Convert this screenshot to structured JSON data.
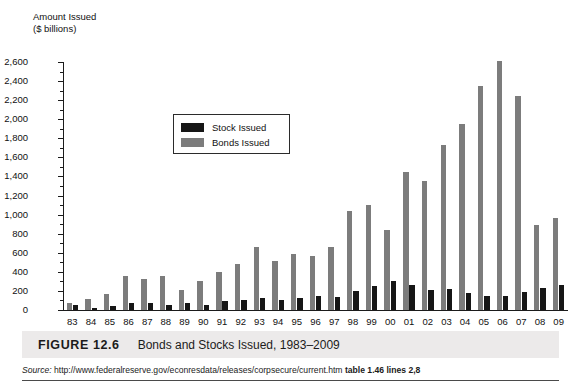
{
  "figure": {
    "number_label": "FIGURE 12.6",
    "title": "Bonds and Stocks Issued, 1983–2009",
    "source_prefix": "Source:",
    "source_url": "http://www.federalreserve.gov/econresdata/releases/corpsecure/current.htm",
    "source_detail": "table 1.46 lines 2,8"
  },
  "legend": {
    "position": "inside-top-left",
    "entries": [
      {
        "label": "Stock Issued",
        "color": "#161616"
      },
      {
        "label": "Bonds Issued",
        "color": "#7c7c7c"
      }
    ]
  },
  "axis": {
    "y_title_line1": "Amount Issued",
    "y_title_line2": "($ billions)",
    "y_ticks": [
      "0",
      "200",
      "400",
      "600",
      "800",
      "1,000",
      "1,200",
      "1,400",
      "1,600",
      "1,800",
      "2,000",
      "2,200",
      "2,400",
      "2,600"
    ]
  },
  "chart_data": {
    "type": "bar",
    "title": "Bonds and Stocks Issued, 1983–2009",
    "xlabel": "",
    "ylabel": "Amount Issued ($ billions)",
    "ylim": [
      0,
      2600
    ],
    "ytick_step": 200,
    "grid": false,
    "legend_position": "upper-left-inside",
    "categories": [
      "83",
      "84",
      "85",
      "86",
      "87",
      "88",
      "89",
      "90",
      "91",
      "92",
      "93",
      "94",
      "95",
      "96",
      "97",
      "98",
      "99",
      "00",
      "01",
      "02",
      "03",
      "04",
      "05",
      "06",
      "07",
      "08",
      "09"
    ],
    "series": [
      {
        "name": "Bonds Issued",
        "color": "#7c7c7c",
        "values": [
          70,
          115,
          170,
          355,
          325,
          355,
          215,
          305,
          400,
          485,
          665,
          510,
          585,
          565,
          660,
          1035,
          1105,
          840,
          1450,
          1355,
          1725,
          1945,
          2350,
          2610,
          2240,
          890,
          965
        ]
      },
      {
        "name": "Stock Issued",
        "color": "#161616",
        "values": [
          50,
          25,
          40,
          75,
          75,
          50,
          70,
          55,
          95,
          105,
          130,
          105,
          125,
          145,
          140,
          200,
          250,
          305,
          265,
          205,
          225,
          175,
          145,
          150,
          185,
          235,
          265
        ]
      }
    ]
  }
}
